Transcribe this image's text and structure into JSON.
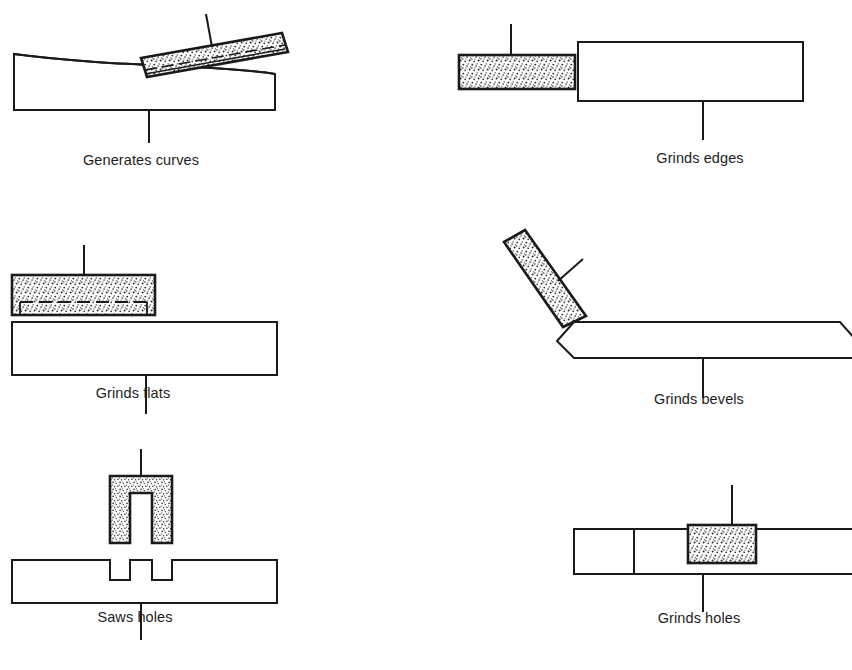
{
  "figure": {
    "background_color": "#ffffff",
    "line_color": "#1a1a1a",
    "stipple_color": "#2a2a2a",
    "columns": 2,
    "rows": 3
  },
  "panels": [
    {
      "id": "generates-curves",
      "label": "Generates curves",
      "operation": "Generates curves",
      "tool": "tilted abrasive stick",
      "tool_texture": "stipple",
      "workpiece": "block with concave curved top face",
      "leader_line": "vertical, below workpiece"
    },
    {
      "id": "grinds-edges",
      "label": "Grinds edges",
      "operation": "Grinds edges",
      "tool": "horizontal abrasive block at left",
      "tool_texture": "stipple",
      "workpiece": "plain rectangular bar at right",
      "leader_line": "vertical, below workpiece"
    },
    {
      "id": "grinds-flats",
      "label": "Grinds flats",
      "operation": "Grinds flats",
      "tool": "abrasive block with recessed dashed face",
      "tool_texture": "stipple",
      "workpiece": "plain rectangular bar below tool",
      "leader_line": "vertical, below workpiece"
    },
    {
      "id": "grinds-bevels",
      "label": "Grinds bevels",
      "operation": "Grinds bevels",
      "tool": "abrasive stick inclined about 45 degrees",
      "tool_texture": "stipple",
      "workpiece": "bar with chamfered corners at both ends",
      "leader_line": "vertical, below workpiece"
    },
    {
      "id": "saws-holes",
      "label": "Saws holes",
      "operation": "Saws holes",
      "tool": "inverted U-shaped saw with stippled legs",
      "tool_texture": "stipple",
      "workpiece": "bar with two slots cut in top face",
      "leader_line": "vertical, above and below workpiece"
    },
    {
      "id": "grinds-holes",
      "label": "Grinds holes",
      "operation": "Grinds holes",
      "tool": "abrasive plug seated in a hole",
      "tool_texture": "stipple",
      "workpiece": "sectioned bar with hole",
      "leader_line": "vertical, above and below workpiece"
    }
  ]
}
